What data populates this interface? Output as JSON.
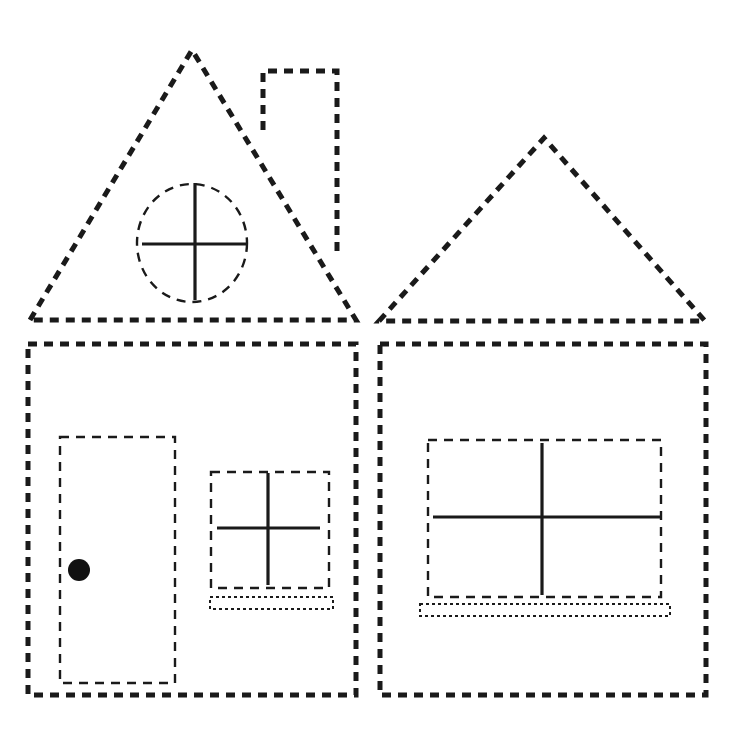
{
  "worksheet": {
    "subject": "house tracing worksheet",
    "background_color": "#ffffff",
    "line_color": "#1a1a1a"
  },
  "left_house": {
    "roof": {
      "shape": "triangle",
      "points": [
        [
          30,
          320
        ],
        [
          192,
          50
        ],
        [
          356,
          320
        ]
      ],
      "style": "thick-dashed"
    },
    "chimney": {
      "shape": "polygon",
      "points": [
        [
          263,
          130
        ],
        [
          263,
          71
        ],
        [
          337,
          71
        ],
        [
          337,
          252
        ]
      ],
      "style": "thick-dashed"
    },
    "attic_window": {
      "shape": "ellipse",
      "cx": 192,
      "cy": 243,
      "rx": 55,
      "ry": 59,
      "style": "medium-dashed",
      "cross": {
        "vertical": [
          195,
          183,
          195,
          300
        ],
        "horizontal": [
          142,
          244,
          247,
          244
        ]
      }
    },
    "wall": {
      "shape": "rect",
      "x": 28,
      "y": 344,
      "width": 328,
      "height": 351,
      "style": "thick-dashed"
    },
    "door": {
      "shape": "rect",
      "x": 60,
      "y": 437,
      "width": 115,
      "height": 246,
      "style": "medium-dashed",
      "knob": {
        "cx": 79,
        "cy": 570,
        "r": 11
      }
    },
    "window": {
      "shape": "rect",
      "x": 211,
      "y": 472,
      "width": 118,
      "height": 116,
      "style": "medium-dashed",
      "cross": {
        "vertical": [
          268,
          473,
          268,
          585
        ],
        "horizontal": [
          217,
          528,
          320,
          528
        ]
      },
      "sill": {
        "x": 210,
        "y": 597,
        "width": 123,
        "height": 12,
        "style": "dotted"
      }
    }
  },
  "right_house": {
    "roof": {
      "shape": "triangle",
      "points": [
        [
          379,
          321
        ],
        [
          544,
          138
        ],
        [
          705,
          321
        ]
      ],
      "style": "thick-dashed"
    },
    "wall": {
      "shape": "rect",
      "x": 380,
      "y": 344,
      "width": 326,
      "height": 351,
      "style": "thick-dashed"
    },
    "window": {
      "shape": "rect",
      "x": 428,
      "y": 440,
      "width": 233,
      "height": 157,
      "style": "medium-dashed",
      "cross": {
        "vertical": [
          542,
          443,
          542,
          595
        ],
        "horizontal": [
          433,
          517,
          660,
          517
        ]
      },
      "sill": {
        "x": 420,
        "y": 604,
        "width": 250,
        "height": 12,
        "style": "dotted"
      }
    }
  }
}
